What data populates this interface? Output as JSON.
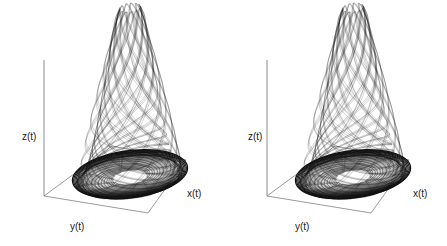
{
  "figure": {
    "background_color": "#ffffff",
    "panel_count": 2
  },
  "panels": [
    {
      "id": "left",
      "name": "attractor-plot-left",
      "axes": {
        "z_label": "z(t)",
        "y_label": "y(t)",
        "x_label": "x(t)"
      }
    },
    {
      "id": "right",
      "name": "attractor-plot-right",
      "axes": {
        "z_label": "z(t)",
        "y_label": "y(t)",
        "x_label": "x(t)"
      }
    }
  ],
  "chart_data": {
    "type": "line",
    "title": "",
    "subtitle": "",
    "xlabel": "x(t)",
    "ylabel": "y(t)",
    "zlabel": "z(t)",
    "projection": "3d-phase-space",
    "grid": false,
    "legend": null,
    "annotations": [],
    "line_color": "#101010",
    "frame_color": "#6e6e6e",
    "series": [
      {
        "name": "trajectory-left",
        "panel": "left",
        "revolutions": 58,
        "sample_points": 5200
      },
      {
        "name": "trajectory-right",
        "panel": "right",
        "revolutions": 58,
        "sample_points": 5200
      }
    ],
    "axis_frame": {
      "base_plane_corners_px": [
        [
          44,
          196
        ],
        [
          112,
          146
        ],
        [
          186,
          160
        ],
        [
          148,
          213
        ]
      ],
      "z_axis_px": [
        [
          44,
          60
        ],
        [
          44,
          196
        ]
      ],
      "peak_apex_px": [
        112,
        15
      ]
    },
    "attractor_params": {
      "model": "roessler-funnel",
      "a": 0.34,
      "b": 0.4,
      "c": 4.5,
      "spiral_growth": 1.031,
      "eject_threshold": 0.92,
      "peak_height_fraction": 0.95
    },
    "ring_structure": {
      "basin_rings": 34,
      "funnel_strands": 24,
      "ring_center_px": [
        115,
        178
      ],
      "ring_radius_max_px": 60,
      "ring_radius_min_px": 17
    }
  }
}
